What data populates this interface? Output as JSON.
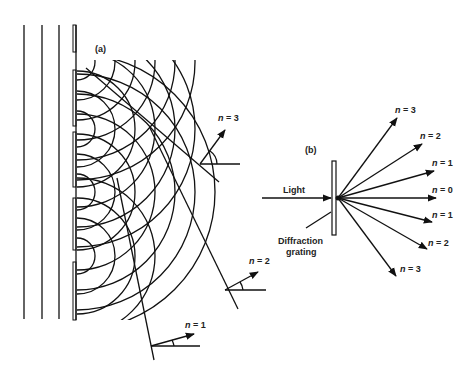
{
  "figure": {
    "panel_a": {
      "label": "(a)",
      "orders": [
        {
          "label": "n = 3",
          "n": "n",
          "eq": " = 3"
        },
        {
          "label": "n = 2",
          "n": "n",
          "eq": " = 2"
        },
        {
          "label": "n = 1",
          "n": "n",
          "eq": " = 1"
        }
      ]
    },
    "panel_b": {
      "label": "(b)",
      "incident_label": "Light",
      "grating_label_line1": "Diffraction",
      "grating_label_line2": "grating",
      "orders": [
        {
          "label": "n = 3",
          "n": "n",
          "eq": " = 3"
        },
        {
          "label": "n = 2",
          "n": "n",
          "eq": " = 2"
        },
        {
          "label": "n = 1",
          "n": "n",
          "eq": " = 1"
        },
        {
          "label": "n = 0",
          "n": "n",
          "eq": " = 0"
        },
        {
          "label": "n = 1",
          "n": "n",
          "eq": " = 1"
        },
        {
          "label": "n = 2",
          "n": "n",
          "eq": " = 2"
        },
        {
          "label": "n = 3",
          "n": "n",
          "eq": " = 3"
        }
      ]
    },
    "colors": {
      "ink": "#111111",
      "background": "#ffffff"
    }
  }
}
